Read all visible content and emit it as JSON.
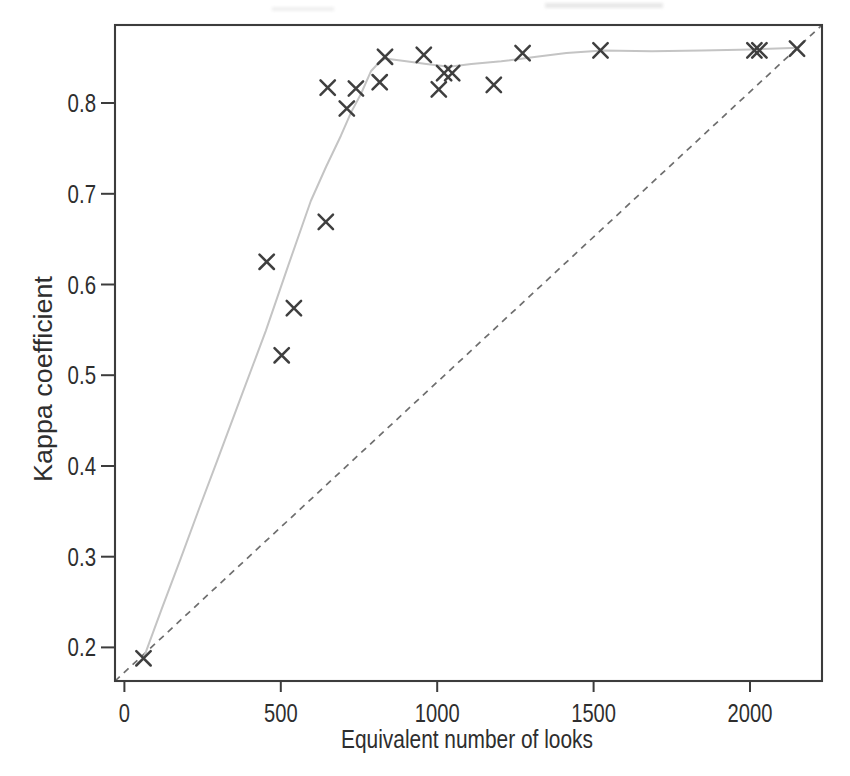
{
  "chart_data": {
    "type": "scatter",
    "title": "",
    "xlabel": "Equivalent number of looks",
    "ylabel": "Kappa coefficient",
    "x_axis": {
      "range": [
        -30,
        2230
      ],
      "ticks": [
        {
          "value": 0,
          "label": "0"
        },
        {
          "value": 500,
          "label": "500"
        },
        {
          "value": 1000,
          "label": "1000"
        },
        {
          "value": 1500,
          "label": "1500"
        },
        {
          "value": 2000,
          "label": "2000"
        }
      ]
    },
    "y_axis": {
      "range": [
        0.163,
        0.886
      ],
      "ticks": [
        {
          "value": 0.2,
          "label": "0.2"
        },
        {
          "value": 0.3,
          "label": "0.3"
        },
        {
          "value": 0.4,
          "label": "0.4"
        },
        {
          "value": 0.5,
          "label": "0.5"
        },
        {
          "value": 0.6,
          "label": "0.6"
        },
        {
          "value": 0.7,
          "label": "0.7"
        },
        {
          "value": 0.8,
          "label": "0.8"
        }
      ]
    },
    "grid": false,
    "legend": "none",
    "marker_style": "x-cross",
    "points": [
      [
        61,
        0.188
      ],
      [
        455,
        0.625
      ],
      [
        503,
        0.522
      ],
      [
        542,
        0.574
      ],
      [
        644,
        0.669
      ],
      [
        650,
        0.817
      ],
      [
        711,
        0.794
      ],
      [
        740,
        0.816
      ],
      [
        816,
        0.823
      ],
      [
        833,
        0.851
      ],
      [
        957,
        0.853
      ],
      [
        1005,
        0.815
      ],
      [
        1022,
        0.833
      ],
      [
        1048,
        0.833
      ],
      [
        1181,
        0.82
      ],
      [
        1273,
        0.855
      ],
      [
        1522,
        0.858
      ],
      [
        2014,
        0.858
      ],
      [
        2030,
        0.858
      ],
      [
        2150,
        0.86
      ]
    ],
    "smooth_line": [
      [
        61,
        0.188
      ],
      [
        120,
        0.243
      ],
      [
        179,
        0.297
      ],
      [
        238,
        0.352
      ],
      [
        298,
        0.407
      ],
      [
        375,
        0.478
      ],
      [
        452,
        0.549
      ],
      [
        524,
        0.621
      ],
      [
        596,
        0.692
      ],
      [
        645,
        0.73
      ],
      [
        692,
        0.764
      ],
      [
        725,
        0.79
      ],
      [
        756,
        0.81
      ],
      [
        788,
        0.835
      ],
      [
        815,
        0.845
      ],
      [
        833,
        0.849
      ],
      [
        901,
        0.846
      ],
      [
        965,
        0.843
      ],
      [
        1038,
        0.84
      ],
      [
        1109,
        0.843
      ],
      [
        1205,
        0.846
      ],
      [
        1317,
        0.851
      ],
      [
        1413,
        0.855
      ],
      [
        1529,
        0.858
      ],
      [
        1686,
        0.857
      ],
      [
        1846,
        0.858
      ],
      [
        2006,
        0.859
      ],
      [
        2157,
        0.861
      ]
    ],
    "reference_line": {
      "style": "dashed",
      "from": [
        -30,
        0.163
      ],
      "to": [
        2230,
        0.886
      ]
    },
    "colors": {
      "marker": "#3f3f3f",
      "smooth_line": "#c4c4c4",
      "reference_line": "#6e6e6e",
      "axis": "#3c3c3c",
      "text": "#2e2e2e",
      "background": "#ffffff"
    }
  }
}
